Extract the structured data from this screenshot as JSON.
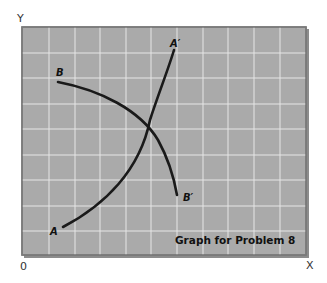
{
  "figure": {
    "caption": "Graph for Problem 8",
    "axes": {
      "y_label": "Y",
      "x_label": "X",
      "origin_label": "0"
    },
    "colors": {
      "plot_bg": "#aaaaaa",
      "grid": "#e8e8e8",
      "border": "#7a7a7a",
      "curve": "#1a1a1a"
    },
    "curves": [
      {
        "name": "AA'",
        "start_label": "A",
        "end_label": "A′",
        "direction": "upward-sloping, convex"
      },
      {
        "name": "BB'",
        "start_label": "B",
        "end_label": "B′",
        "direction": "downward-sloping, concave"
      }
    ],
    "grid": {
      "columns": 11,
      "rows": 9
    }
  }
}
